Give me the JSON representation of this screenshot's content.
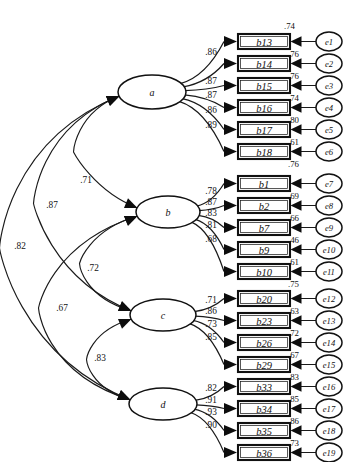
{
  "diagram": {
    "type": "cfa-path-diagram",
    "caption": "",
    "stroke_color": "#111111",
    "background_color": "#ffffff"
  },
  "factors": [
    {
      "id": "a",
      "label": "a",
      "cx": 152,
      "cy": 92,
      "rx": 34,
      "ry": 17
    },
    {
      "id": "b",
      "label": "b",
      "cx": 168,
      "cy": 212,
      "rx": 32,
      "ry": 16
    },
    {
      "id": "c",
      "label": "c",
      "cx": 163,
      "cy": 315,
      "rx": 33,
      "ry": 16
    },
    {
      "id": "d",
      "label": "d",
      "cx": 163,
      "cy": 404,
      "rx": 34,
      "ry": 16
    }
  ],
  "indicators": [
    {
      "id": "b13",
      "label": "b13",
      "factor": "a",
      "loading": ".86",
      "residual": ".76",
      "top_residual": ".74",
      "error": "e1",
      "y": 34
    },
    {
      "id": "b14",
      "label": "b14",
      "factor": "a",
      "loading": "",
      "residual": ".76",
      "error": "e2",
      "y": 56
    },
    {
      "id": "b15",
      "label": "b15",
      "factor": "a",
      "loading": ".87",
      "residual": ".74",
      "error": "e3",
      "y": 78
    },
    {
      "id": "b16",
      "label": "b16",
      "factor": "a",
      "loading": ".87",
      "residual": ".80",
      "error": "e4",
      "y": 100
    },
    {
      "id": "b17",
      "label": "b17",
      "factor": "a",
      "loading": ".86",
      "residual": ".61",
      "error": "e5",
      "y": 122
    },
    {
      "id": "b18",
      "label": "b18",
      "factor": "a",
      "loading": ".89",
      "residual": ".76",
      "error": "e6",
      "y": 144
    },
    {
      "id": "b1",
      "label": "b1",
      "factor": "b",
      "loading": ".78",
      "residual": ".69",
      "error": "e7",
      "y": 176
    },
    {
      "id": "b2",
      "label": "b2",
      "factor": "b",
      "loading": ".87",
      "residual": ".66",
      "error": "e8",
      "y": 198
    },
    {
      "id": "b7",
      "label": "b7",
      "factor": "b",
      "loading": ".83",
      "residual": ".46",
      "error": "e9",
      "y": 220
    },
    {
      "id": "b9",
      "label": "b9",
      "factor": "b",
      "loading": ".81",
      "residual": ".61",
      "error": "e10",
      "y": 242
    },
    {
      "id": "b10",
      "label": "b10",
      "factor": "b",
      "loading": ".68",
      "residual": ".75",
      "error": "e11",
      "y": 264
    },
    {
      "id": "b20",
      "label": "b20",
      "factor": "c",
      "loading": ".71",
      "residual": ".63",
      "error": "e12",
      "y": 291
    },
    {
      "id": "b23",
      "label": "b23",
      "factor": "c",
      "loading": ".86",
      "residual": ".72",
      "error": "e13",
      "y": 313
    },
    {
      "id": "b26",
      "label": "b26",
      "factor": "c",
      "loading": ".73",
      "residual": ".67",
      "error": "e14",
      "y": 335
    },
    {
      "id": "b29",
      "label": "b29",
      "factor": "c",
      "loading": ".85",
      "residual": ".83",
      "error": "e15",
      "y": 357
    },
    {
      "id": "b33",
      "label": "b33",
      "factor": "d",
      "loading": ".82",
      "residual": ".85",
      "error": "e16",
      "y": 379
    },
    {
      "id": "b34",
      "label": "b34",
      "factor": "d",
      "loading": ".91",
      "residual": ".86",
      "error": "e17",
      "y": 401
    },
    {
      "id": "b35",
      "label": "b35",
      "factor": "d",
      "loading": ".93",
      "residual": ".73",
      "error": "e18",
      "y": 423
    },
    {
      "id": "b36",
      "label": "b36",
      "factor": "d",
      "loading": ".90",
      "residual": "",
      "error": "e19",
      "y": 445
    }
  ],
  "factor_loadings_displayed": {
    "a": [
      ".86",
      "",
      ".87",
      ".87",
      ".86",
      ".89",
      ".78"
    ],
    "b": [
      "",
      ".87",
      ".83",
      ".81",
      ".68",
      ".71"
    ],
    "c": [
      ".86",
      ".73",
      ".85",
      ".82"
    ],
    "d": [
      ".91",
      ".93",
      ".90",
      ".85"
    ]
  },
  "correlations": [
    {
      "id": "a-b",
      "from": "a",
      "to": "b",
      "value": ".71",
      "label_x": 86,
      "label_y": 180
    },
    {
      "id": "a-c",
      "from": "a",
      "to": "c",
      "value": ".87",
      "label_x": 52,
      "label_y": 205
    },
    {
      "id": "a-d",
      "from": "a",
      "to": "d",
      "value": ".82",
      "label_x": 20,
      "label_y": 246
    },
    {
      "id": "b-c",
      "from": "b",
      "to": "c",
      "value": ".72",
      "label_x": 93,
      "label_y": 268
    },
    {
      "id": "b-d",
      "from": "b",
      "to": "d",
      "value": ".67",
      "label_x": 62,
      "label_y": 308
    },
    {
      "id": "c-d",
      "from": "c",
      "to": "d",
      "value": ".83",
      "label_x": 100,
      "label_y": 358
    }
  ],
  "errors": [
    {
      "id": "e1",
      "label": "e1"
    },
    {
      "id": "e2",
      "label": "e2"
    },
    {
      "id": "e3",
      "label": "e3"
    },
    {
      "id": "e4",
      "label": "e4"
    },
    {
      "id": "e5",
      "label": "e5"
    },
    {
      "id": "e6",
      "label": "e6"
    },
    {
      "id": "e7",
      "label": "e7"
    },
    {
      "id": "e8",
      "label": "e8"
    },
    {
      "id": "e9",
      "label": "e9"
    },
    {
      "id": "e10",
      "label": "e10"
    },
    {
      "id": "e11",
      "label": "e11"
    },
    {
      "id": "e12",
      "label": "e12"
    },
    {
      "id": "e13",
      "label": "e13"
    },
    {
      "id": "e14",
      "label": "e14"
    },
    {
      "id": "e15",
      "label": "e15"
    },
    {
      "id": "e16",
      "label": "e16"
    },
    {
      "id": "e17",
      "label": "e17"
    },
    {
      "id": "e18",
      "label": "e18"
    },
    {
      "id": "e19",
      "label": "e19"
    }
  ],
  "geometry": {
    "box_x": 238,
    "box_width": 52,
    "box_height": 15,
    "error_cx": 329,
    "error_rx": 13,
    "error_ry": 9.5
  }
}
